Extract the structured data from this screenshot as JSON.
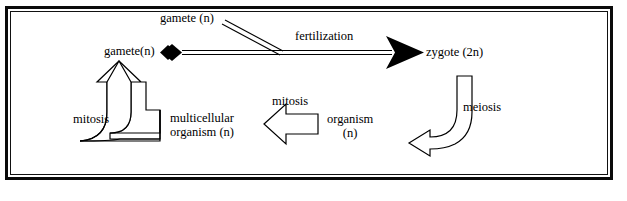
{
  "diagram": {
    "background_color": "#ffffff",
    "ink_color": "#000000",
    "labels": {
      "gamete_top": "gamete (n)",
      "gamete_left": "gamete(n)",
      "fertilization": "fertilization",
      "zygote": "zygote (2n)",
      "meiosis": "meiosis",
      "mitosis_middle": "mitosis",
      "mitosis_left": "mitosis",
      "multicellular_line1": "multicellular",
      "multicellular_line2": "organism (n)",
      "organism_line1": "organism",
      "organism_line2": "(n)"
    },
    "connectors": [
      {
        "name": "fertilization-arrow",
        "label": "fertilization",
        "from": "gamete(n)",
        "to": "zygote (2n)",
        "style": "double-line-with-solid-arrowhead",
        "start_marker": "solid-diamond"
      },
      {
        "name": "gamete-join-line",
        "label": "",
        "from": "gamete (n)",
        "to": "fertilization-arrow",
        "style": "double-line-diagonal"
      },
      {
        "name": "meiosis-arrow",
        "label": "meiosis",
        "from": "zygote (2n)",
        "to": "organism (n)",
        "style": "curved-hollow-block-arrow"
      },
      {
        "name": "mitosis-middle-arrow",
        "label": "mitosis",
        "from": "organism (n)",
        "to": "multicellular organism (n)",
        "style": "straight-hollow-block-arrow-left"
      },
      {
        "name": "mitosis-left-arrow",
        "label": "mitosis",
        "from": "multicellular organism (n)",
        "to": "gamete(n)",
        "style": "curved-hollow-block-arrow-up"
      }
    ]
  }
}
